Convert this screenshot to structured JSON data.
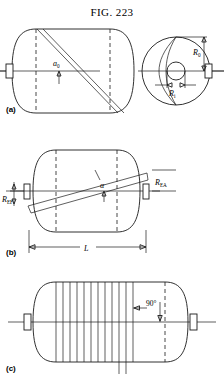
{
  "figure": {
    "title_prefix": "F",
    "title_rest": "IG",
    "title_num": ". 223",
    "title_full": "FIG. 223"
  },
  "panels": [
    {
      "id": "a",
      "label": "(a)",
      "description": "Side elevation of filament-wound pressure vessel with single helical band, and end view showing polar boss radii",
      "annotations": [
        {
          "name": "helix-width-label",
          "text": "a",
          "sub": "0"
        },
        {
          "name": "outer-radius-label",
          "text": "R",
          "sub": "0"
        },
        {
          "name": "inner-radius-label",
          "text": "R",
          "sub": "i"
        }
      ]
    },
    {
      "id": "b",
      "label": "(b)",
      "description": "Side elevation showing helical winding angle alpha and band radii at entry and exit",
      "annotations": [
        {
          "name": "wind-angle-label",
          "text": "α",
          "sub": ""
        },
        {
          "name": "radius-ef-label",
          "text": "R",
          "sub": "EF"
        },
        {
          "name": "radius-ea-label",
          "text": "R",
          "sub": "EA"
        },
        {
          "name": "length-label",
          "text": "L",
          "sub": ""
        }
      ]
    },
    {
      "id": "c",
      "label": "(c)",
      "description": "Side elevation with hoop windings applied circumferentially at ninety degrees to the vessel axis",
      "annotations": [
        {
          "name": "hoop-angle-label",
          "text": "90",
          "sub": "°"
        }
      ],
      "hoop_band_count": 9
    }
  ],
  "colors": {
    "line": "#1a1a1a",
    "background": "#ffffff"
  }
}
